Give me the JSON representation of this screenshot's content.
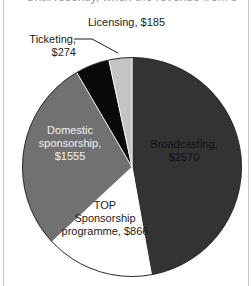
{
  "page": {
    "clipped_caption": "Until recently, when the revenue from s",
    "frame_color": "#c9c9c9",
    "background": "#ffffff"
  },
  "chart_data": {
    "type": "pie",
    "title": "",
    "currency_prefix": "$",
    "total": 5450,
    "categories": [
      "Broadcasting",
      "TOP Sponsorship programme",
      "Domestic sponsorship",
      "Ticketing",
      "Licensing"
    ],
    "values": [
      2570,
      866,
      1555,
      274,
      185
    ],
    "slices": [
      {
        "name": "Broadcasting",
        "label_line1": "Broadcasting,",
        "label_line2": "$2570",
        "value": 2570,
        "color": "#333333",
        "text_color": "#111111",
        "start_angle": 0,
        "sweep_angle": 169.8,
        "label_placement": "inside"
      },
      {
        "name": "TOP Sponsorship programme",
        "label_line1": "TOP",
        "label_line2": "Sponsorship",
        "label_line3": "programme, $866",
        "value": 866,
        "color": "#ffffff",
        "text_color": "#1c1c1c",
        "start_angle": 169.8,
        "sweep_angle": 57.2,
        "label_placement": "inside"
      },
      {
        "name": "Domestic sponsorship",
        "label_line1": "Domestic",
        "label_line2": "sponsorship,",
        "label_line3": "$1555",
        "value": 1555,
        "color": "#717171",
        "text_color": "#f2f2f2",
        "start_angle": 227.0,
        "sweep_angle": 102.7,
        "label_placement": "inside"
      },
      {
        "name": "Ticketing",
        "label_line1": "Ticketing,",
        "label_line2": "$274",
        "value": 274,
        "color": "#0a0a0a",
        "text_color": "#1c1c1c",
        "start_angle": 329.7,
        "sweep_angle": 18.1,
        "label_placement": "outside-leader"
      },
      {
        "name": "Licensing",
        "label_line1": "Licensing, $185",
        "value": 185,
        "color": "#c4c4c4",
        "text_color": "#1c1c1c",
        "start_angle": 347.8,
        "sweep_angle": 12.2,
        "label_placement": "outside"
      }
    ],
    "legend": "none",
    "grid": false
  }
}
